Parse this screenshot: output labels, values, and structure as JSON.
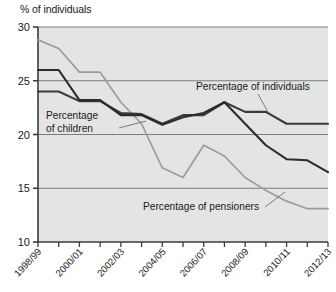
{
  "chart_data": {
    "type": "line",
    "title": "",
    "subtitle": "",
    "ylabel": "% of individuals",
    "xlabel": "",
    "ylim": [
      10,
      30
    ],
    "yticks": [
      10,
      15,
      20,
      25,
      30
    ],
    "ytick_labels": [
      "10",
      "15",
      "20",
      "25",
      "30"
    ],
    "grid": true,
    "grid_axis": "y",
    "legend_position": "inline-annotations",
    "x": [
      "1998/99",
      "1999/00",
      "2000/01",
      "2001/02",
      "2002/03",
      "2003/04",
      "2004/05",
      "2005/06",
      "2006/07",
      "2007/08",
      "2008/09",
      "2009/10",
      "2010/11",
      "2011/12",
      "2012/13"
    ],
    "xtick_labels_shown": [
      "1998/99",
      "2000/01",
      "2002/03",
      "2004/05",
      "2006/07",
      "2008/09",
      "2010/11",
      "2012/13"
    ],
    "series": [
      {
        "name": "Percentage of individuals",
        "color": "#3a3a3a",
        "values": [
          24.0,
          24.0,
          23.1,
          23.1,
          22.0,
          21.9,
          21.0,
          21.8,
          21.8,
          23.0,
          22.1,
          22.1,
          21.0,
          21.0,
          21.0
        ]
      },
      {
        "name": "Percentage of children",
        "color": "#2b2b2b",
        "values": [
          26.0,
          26.0,
          23.2,
          23.2,
          21.8,
          21.8,
          20.9,
          21.6,
          22.0,
          23.0,
          21.0,
          19.0,
          17.7,
          17.6,
          16.5
        ]
      },
      {
        "name": "Percentage of pensioners",
        "color": "#9c9c9c",
        "values": [
          28.8,
          28.0,
          25.8,
          25.8,
          23.0,
          21.0,
          16.9,
          16.0,
          19.0,
          18.0,
          16.0,
          14.8,
          13.8,
          13.1,
          13.1
        ]
      }
    ],
    "annotations": [
      {
        "text": "Percentage of individuals",
        "target_series": "Percentage of individuals"
      },
      {
        "text": "Percentage of children",
        "target_series": "Percentage of children"
      },
      {
        "text": "Percentage of pensioners",
        "target_series": "Percentage of pensioners"
      }
    ]
  },
  "plot": {
    "background_color": "#e4e4e4",
    "gridline_color": "#7c7c7c",
    "axis_color": "#3c3c3c"
  }
}
